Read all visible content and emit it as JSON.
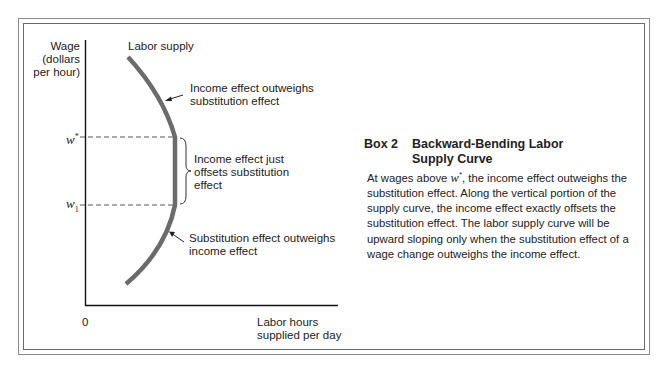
{
  "figure": {
    "y_axis_label": [
      "Wage",
      "(dollars",
      "per hour)"
    ],
    "x_axis_label": [
      "Labor hours",
      "supplied per day"
    ],
    "origin_label": "0",
    "tick_w_star": "w",
    "tick_w_star_sup": "*",
    "tick_w1": "w",
    "tick_w1_sub": "1",
    "curve_label": "Labor supply",
    "annotations": {
      "top": [
        "Income effect outweighs",
        "substitution effect"
      ],
      "middle": [
        "Income effect just",
        "offsets substitution",
        "effect"
      ],
      "bottom": [
        "Substitution effect outweighs",
        "income effect"
      ]
    },
    "colors": {
      "curve": "#6b6b6b",
      "axis": "#111111",
      "dashed": "#555555",
      "frame": "#8a8a8a"
    }
  },
  "box": {
    "number": "Box 2",
    "title_line1": "Backward-Bending Labor",
    "title_line2": "Supply Curve",
    "body_pre": "At wages above ",
    "body_var": "w",
    "body_sup": "*",
    "body_post": ", the income effect outweighs the substitution effect.  Along the vertical portion of the supply curve, the income effect exactly offsets the substitution effect.  The labor supply curve will be upward sloping only when the substitution effect of a wage change outweighs the income effect."
  }
}
